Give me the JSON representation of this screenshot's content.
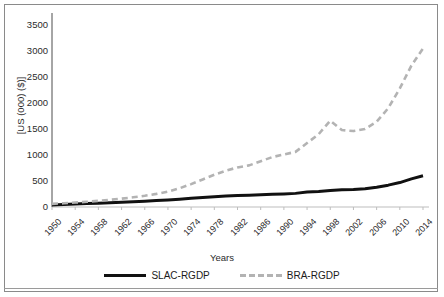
{
  "chart_data": {
    "type": "line",
    "title": "",
    "xlabel": "Years",
    "ylabel": "[US (000) ($)]",
    "ylim": [
      0,
      3500
    ],
    "ytick_step": 500,
    "yticks": [
      3500,
      3000,
      2500,
      2000,
      1500,
      1000,
      500,
      0
    ],
    "grid": false,
    "legend_position": "bottom-center",
    "categories": [
      1950,
      1952,
      1954,
      1956,
      1958,
      1960,
      1962,
      1964,
      1966,
      1968,
      1970,
      1972,
      1974,
      1976,
      1978,
      1980,
      1982,
      1984,
      1986,
      1988,
      1990,
      1992,
      1994,
      1996,
      1998,
      2000,
      2002,
      2004,
      2006,
      2008,
      2010,
      2012,
      2014
    ],
    "xtick_labels": [
      "1950",
      "1954",
      "1958",
      "1962",
      "1966",
      "1970",
      "1974",
      "1978",
      "1982",
      "1986",
      "1990",
      "1994",
      "1998",
      "2002",
      "2006",
      "2010",
      "2014"
    ],
    "series": [
      {
        "name": "SLAC-RGDP",
        "style": "solid",
        "color": "#111111",
        "values": [
          40,
          50,
          58,
          66,
          74,
          82,
          92,
          102,
          112,
          124,
          136,
          150,
          166,
          182,
          198,
          212,
          222,
          228,
          236,
          244,
          252,
          262,
          288,
          300,
          318,
          330,
          336,
          350,
          380,
          420,
          470,
          540,
          600
        ]
      },
      {
        "name": "BRA-RGDP",
        "style": "dashed",
        "color": "#b3b3b3",
        "values": [
          60,
          72,
          86,
          100,
          118,
          138,
          160,
          186,
          216,
          252,
          296,
          360,
          440,
          530,
          620,
          700,
          760,
          800,
          880,
          960,
          1010,
          1060,
          1230,
          1400,
          1660,
          1480,
          1460,
          1500,
          1640,
          1900,
          2280,
          2720,
          3050
        ]
      }
    ]
  },
  "legend": {
    "entries": [
      {
        "label": "SLAC-RGDP",
        "style": "solid"
      },
      {
        "label": "BRA-RGDP",
        "style": "dashed"
      }
    ]
  }
}
